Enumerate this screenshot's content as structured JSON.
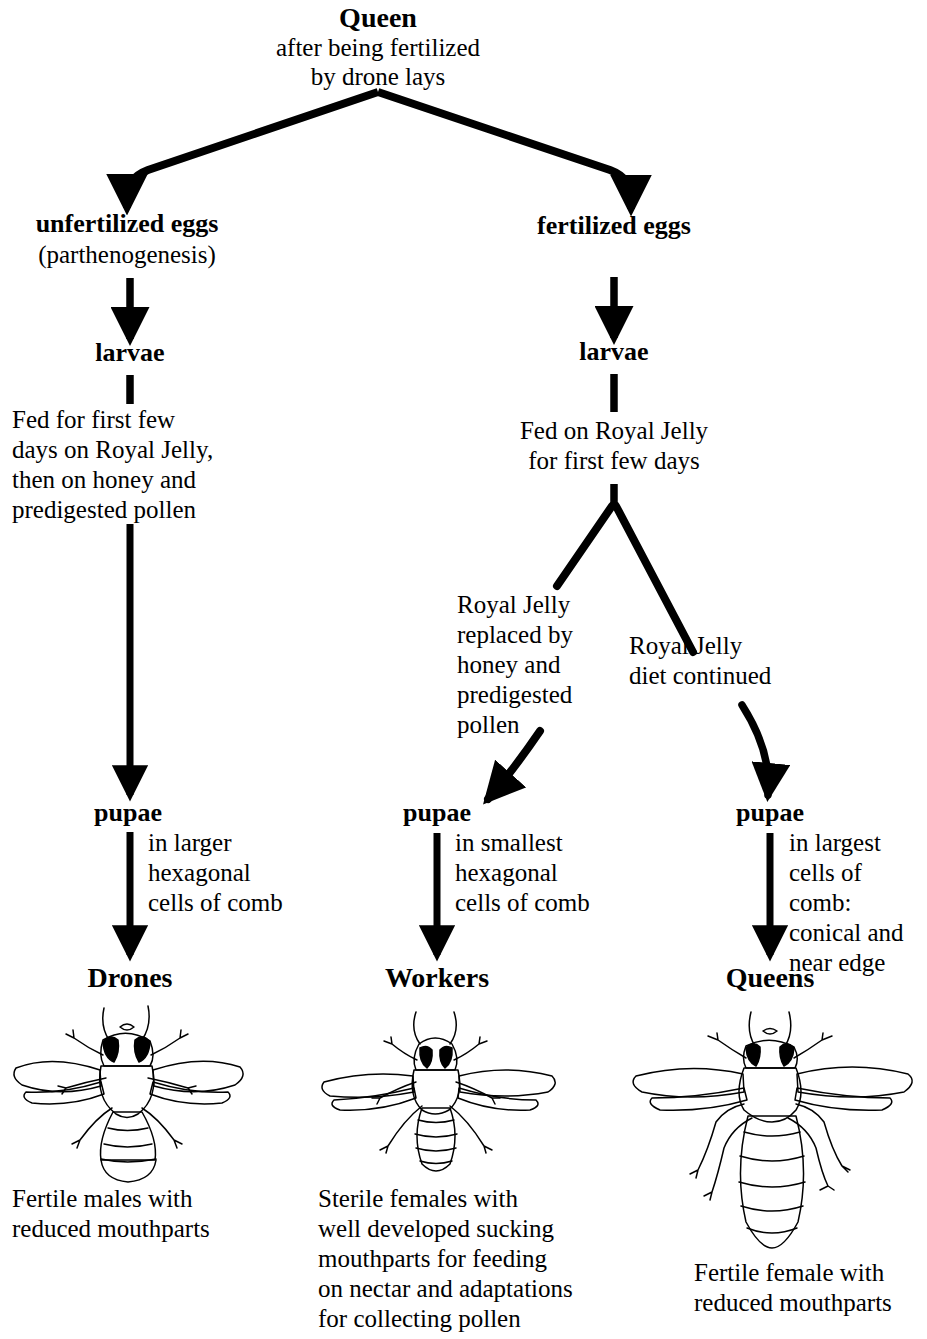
{
  "diagram": {
    "colors": {
      "ink": "#000000",
      "background": "#ffffff"
    },
    "root": {
      "heading": "Queen",
      "subtitle_line1": "after being fertilized",
      "subtitle_line2": "by drone lays"
    },
    "branches": {
      "left": {
        "eggs_label": "unfertilized eggs",
        "eggs_note": "(parthenogenesis)",
        "larvae_label": "larvae",
        "feeding_line1": "Fed for first few",
        "feeding_line2": "days on Royal Jelly,",
        "feeding_line3": "then on honey and",
        "feeding_line4": "predigested pollen",
        "pupae_label": "pupae",
        "pupae_note_line1": "in larger",
        "pupae_note_line2": "hexagonal",
        "pupae_note_line3": "cells of comb",
        "caste_label": "Drones",
        "caste_icon": "drone-bee-icon",
        "caption_line1": "Fertile males with",
        "caption_line2": "reduced mouthparts"
      },
      "right": {
        "eggs_label": "fertilized eggs",
        "larvae_label": "larvae",
        "feeding_line1": "Fed on Royal Jelly",
        "feeding_line2": "for first few days"
      }
    },
    "sub_branches": {
      "worker": {
        "diet_line1": "Royal Jelly",
        "diet_line2": "replaced by",
        "diet_line3": "honey and",
        "diet_line4": "predigested",
        "diet_line5": "pollen",
        "pupae_label": "pupae",
        "pupae_note_line1": "in smallest",
        "pupae_note_line2": "hexagonal",
        "pupae_note_line3": "cells of comb",
        "caste_label": "Workers",
        "caste_icon": "worker-bee-icon",
        "caption_line1": "Sterile females with",
        "caption_line2": "well developed sucking",
        "caption_line3": "mouthparts for feeding",
        "caption_line4": "on nectar and adaptations",
        "caption_line5": "for collecting pollen"
      },
      "queen": {
        "diet_line1": "Royal Jelly",
        "diet_line2": "diet continued",
        "pupae_label": "pupae",
        "pupae_note_line1": "in largest",
        "pupae_note_line2": "cells of",
        "pupae_note_line3": "comb:",
        "pupae_note_line4": "conical and",
        "pupae_note_line5": "near edge",
        "caste_label": "Queens",
        "caste_icon": "queen-bee-icon",
        "caption_line1": "Fertile female with",
        "caption_line2": "reduced mouthparts"
      }
    }
  }
}
